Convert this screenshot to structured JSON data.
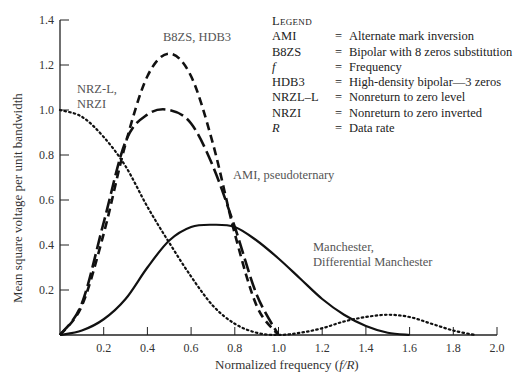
{
  "chart_data": {
    "type": "line",
    "title": "",
    "xlabel": "Normalized frequency (f/R)",
    "ylabel": "Mean square voltage per unit bandwidth",
    "xlim": [
      0,
      2.0
    ],
    "ylim": [
      0,
      1.4
    ],
    "grid": false,
    "x_ticks": [
      "0.2",
      "0.4",
      "0.6",
      "0.8",
      "1.0",
      "1.2",
      "1.4",
      "1.6",
      "1.8",
      "2.0"
    ],
    "y_ticks": [
      "0.2",
      "0.4",
      "0.6",
      "0.8",
      "1.0",
      "1.2",
      "1.4"
    ],
    "x": [
      0,
      0.1,
      0.2,
      0.3,
      0.4,
      0.5,
      0.6,
      0.7,
      0.8,
      0.9,
      1.0,
      1.1,
      1.2,
      1.3,
      1.4,
      1.5,
      1.6,
      1.7,
      1.8,
      1.9,
      2.0
    ],
    "series": [
      {
        "name": "NRZ-L, NRZI",
        "style": "dotted",
        "values": [
          1.0,
          0.97,
          0.88,
          0.75,
          0.57,
          0.41,
          0.26,
          0.13,
          0.05,
          0.01,
          0.0,
          0.01,
          0.03,
          0.06,
          0.08,
          0.09,
          0.08,
          0.05,
          0.02,
          0.0,
          0.0
        ]
      },
      {
        "name": "B8ZS, HDB3",
        "style": "short-dash",
        "values": [
          0.0,
          0.13,
          0.45,
          0.85,
          1.15,
          1.25,
          1.15,
          0.85,
          0.45,
          0.13,
          0.0,
          0.0,
          0.0,
          0.0,
          0.0,
          0.0,
          0.0,
          0.0,
          0.0,
          0.0,
          0.0
        ]
      },
      {
        "name": "AMI, pseudoternary",
        "style": "long-dash",
        "values": [
          0.0,
          0.14,
          0.5,
          0.86,
          0.98,
          1.0,
          0.94,
          0.75,
          0.48,
          0.18,
          0.0,
          0.0,
          0.0,
          0.0,
          0.0,
          0.0,
          0.0,
          0.0,
          0.0,
          0.0,
          0.0
        ]
      },
      {
        "name": "Manchester, Differential Manchester",
        "style": "solid",
        "values": [
          0.0,
          0.02,
          0.07,
          0.16,
          0.3,
          0.42,
          0.48,
          0.49,
          0.48,
          0.42,
          0.34,
          0.25,
          0.16,
          0.09,
          0.04,
          0.01,
          0.0,
          0.0,
          0.0,
          0.0,
          0.0
        ]
      }
    ],
    "annotations": [
      {
        "text": "NRZ-L,\nNRZI",
        "x": 0.07,
        "y": 1.08
      },
      {
        "text": "B8ZS, HDB3",
        "x": 0.6,
        "y": 1.33
      },
      {
        "text": "AMI, pseudoternary",
        "x": 0.8,
        "y": 0.62
      },
      {
        "text": "Manchester,\nDifferential Manchester",
        "x": 1.12,
        "y": 0.42
      }
    ],
    "legend_position": "top-right"
  },
  "labels": {
    "y_axis": "Mean square voltage per unit bandwidth",
    "x_axis_prefix": "Normalized frequency (",
    "x_axis_var": "f/R",
    "x_axis_suffix": ")",
    "nrz_1": "NRZ-L,",
    "nrz_2": "NRZI",
    "b8zs": "B8ZS, HDB3",
    "ami": "AMI, pseudoternary",
    "manch_1": "Manchester,",
    "manch_2": "Differential Manchester"
  },
  "legend": {
    "title": "Legend",
    "items": [
      {
        "key": "AMI",
        "desc": "Alternate mark inversion"
      },
      {
        "key": "B8ZS",
        "desc": "Bipolar with 8 zeros substitution"
      },
      {
        "key": "f",
        "desc": "Frequency"
      },
      {
        "key": "HDB3",
        "desc": "High-density bipolar—3 zeros"
      },
      {
        "key": "NRZL–L",
        "desc": "Nonreturn to zero level"
      },
      {
        "key": "NRZI",
        "desc": "Nonreturn to zero inverted"
      },
      {
        "key": "R",
        "desc": "Data rate"
      }
    ],
    "eq": "="
  }
}
